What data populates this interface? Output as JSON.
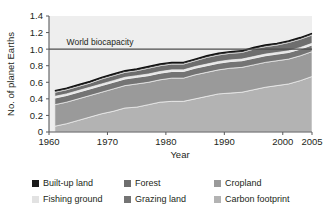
{
  "chart_data": {
    "type": "area",
    "title": "",
    "xlabel": "Year",
    "ylabel": "No. of planet Earths",
    "xlim": [
      1960,
      2005
    ],
    "ylim": [
      0,
      1.4
    ],
    "grid": false,
    "stacked": true,
    "legend_position": "bottom",
    "xticks": [
      1960,
      1970,
      1980,
      1990,
      2000,
      2005
    ],
    "xtick_labels": [
      "1960",
      "1970",
      "1980",
      "1990",
      "2000",
      "2005"
    ],
    "yticks": [
      0,
      0.2,
      0.4,
      0.6,
      0.8,
      1.0,
      1.2,
      1.4
    ],
    "ytick_labels": [
      "0",
      "0.2",
      "0.4",
      "0.6",
      "0.8",
      "1.0",
      "1.2",
      "1.4"
    ],
    "annotations": [
      {
        "text": "World biocapacity",
        "x": 1963,
        "y": 1.04,
        "line_y": 1.0,
        "line_from_x": 1960,
        "line_to_x": 2005
      }
    ],
    "x": [
      1961,
      1963,
      1965,
      1967,
      1969,
      1971,
      1973,
      1975,
      1977,
      1979,
      1981,
      1983,
      1985,
      1987,
      1989,
      1991,
      1993,
      1995,
      1997,
      1999,
      2001,
      2003,
      2005
    ],
    "series": [
      {
        "name": "Carbon footprint",
        "color": "#b3b3b3",
        "values": [
          0.07,
          0.1,
          0.14,
          0.18,
          0.22,
          0.25,
          0.29,
          0.3,
          0.33,
          0.36,
          0.37,
          0.37,
          0.4,
          0.43,
          0.46,
          0.47,
          0.48,
          0.51,
          0.54,
          0.56,
          0.58,
          0.62,
          0.67
        ]
      },
      {
        "name": "Cropland",
        "color": "#9a9a9a",
        "values": [
          0.26,
          0.26,
          0.26,
          0.26,
          0.26,
          0.27,
          0.27,
          0.28,
          0.27,
          0.27,
          0.28,
          0.28,
          0.29,
          0.29,
          0.29,
          0.3,
          0.3,
          0.3,
          0.3,
          0.3,
          0.3,
          0.3,
          0.3
        ]
      },
      {
        "name": "Grazing land",
        "color": "#747474",
        "values": [
          0.08,
          0.08,
          0.08,
          0.08,
          0.08,
          0.08,
          0.08,
          0.08,
          0.08,
          0.08,
          0.08,
          0.08,
          0.08,
          0.08,
          0.08,
          0.08,
          0.08,
          0.08,
          0.08,
          0.08,
          0.08,
          0.08,
          0.08
        ]
      },
      {
        "name": "Fishing ground",
        "color": "#e2e2e2",
        "values": [
          0.02,
          0.02,
          0.02,
          0.02,
          0.02,
          0.02,
          0.02,
          0.02,
          0.02,
          0.02,
          0.02,
          0.02,
          0.02,
          0.02,
          0.02,
          0.02,
          0.02,
          0.02,
          0.02,
          0.02,
          0.02,
          0.02,
          0.02
        ]
      },
      {
        "name": "Forest",
        "color": "#6e6e6e",
        "values": [
          0.05,
          0.05,
          0.05,
          0.05,
          0.06,
          0.06,
          0.06,
          0.06,
          0.07,
          0.07,
          0.07,
          0.07,
          0.07,
          0.08,
          0.08,
          0.08,
          0.08,
          0.09,
          0.09,
          0.09,
          0.1,
          0.1,
          0.1
        ]
      },
      {
        "name": "Built-up land",
        "color": "#1a1a1a",
        "values": [
          0.02,
          0.02,
          0.02,
          0.02,
          0.02,
          0.02,
          0.02,
          0.02,
          0.02,
          0.02,
          0.02,
          0.02,
          0.02,
          0.02,
          0.02,
          0.02,
          0.02,
          0.02,
          0.02,
          0.02,
          0.02,
          0.02,
          0.02
        ]
      }
    ],
    "totals": [
      0.5,
      0.53,
      0.57,
      0.61,
      0.66,
      0.7,
      0.74,
      0.76,
      0.79,
      0.82,
      0.84,
      0.84,
      0.88,
      0.92,
      0.95,
      0.97,
      0.98,
      1.02,
      1.05,
      1.07,
      1.1,
      1.14,
      1.19
    ]
  },
  "legend": {
    "items": [
      {
        "label": "Built-up land",
        "color": "#1a1a1a",
        "key": "built-up-land"
      },
      {
        "label": "Forest",
        "color": "#6e6e6e",
        "key": "forest"
      },
      {
        "label": "Cropland",
        "color": "#9a9a9a",
        "key": "cropland"
      },
      {
        "label": "Fishing ground",
        "color": "#e2e2e2",
        "key": "fishing-ground"
      },
      {
        "label": "Grazing land",
        "color": "#747474",
        "key": "grazing-land"
      },
      {
        "label": "Carbon footprint",
        "color": "#b3b3b3",
        "key": "carbon-footprint"
      }
    ]
  },
  "axes": {
    "y_title": "No. of planet Earths",
    "x_title": "Year",
    "ytick_0": "0",
    "ytick_1": "0.2",
    "ytick_2": "0.4",
    "ytick_3": "0.6",
    "ytick_4": "0.8",
    "ytick_5": "1.0",
    "ytick_6": "1.2",
    "ytick_7": "1.4",
    "xtick_0": "1960",
    "xtick_1": "1970",
    "xtick_2": "1980",
    "xtick_3": "1990",
    "xtick_4": "2000",
    "xtick_5": "2005"
  },
  "annotation": {
    "biocapacity_label": "World biocapacity"
  },
  "colors": {
    "plot_background": "#eeeeee",
    "axis": "#58595b",
    "text": "#231f20",
    "biocapacity_line": "#4d4d4d",
    "band_outline": "#f2f2f2"
  }
}
